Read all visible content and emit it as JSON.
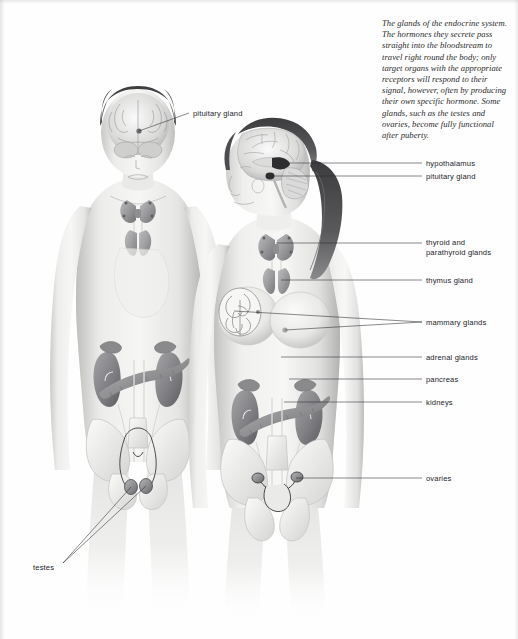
{
  "figure": {
    "title": "The glands of the endocrine system",
    "caption": "The glands of the endocrine system. The hormones they secrete pass straight into the bloodstream to travel right round the body; only target organs with the appropriate receptors will respond to their signal, however, often by producing their own specific hormone. Some glands, such as the testes and ovaries, become fully functional after puberty."
  },
  "colors": {
    "page_background": "#fefefe",
    "label_text": "#23242b",
    "caption_text": "#2b2b2b",
    "leader_line": "#2a2a30",
    "skin_light": "#f2f2f0",
    "skin_mid": "#d8d8d6",
    "skin_shadow": "#a9a9aa",
    "organ_mid": "#9a9a9c",
    "organ_dark": "#6e6e72",
    "hair_dark": "#3a3a3c"
  },
  "labels": {
    "left": [
      {
        "id": "pituitary-gland-male",
        "text": "pituitary gland",
        "x": 193,
        "y": 109,
        "leader": {
          "x1": 189,
          "y1": 113,
          "x2": 139,
          "y2": 131
        }
      },
      {
        "id": "testes",
        "text": "testes",
        "x": 33,
        "y": 563,
        "leaders": [
          {
            "x1": 63,
            "y1": 563,
            "x2": 131,
            "y2": 487
          },
          {
            "x1": 63,
            "y1": 563,
            "x2": 146,
            "y2": 486
          }
        ]
      }
    ],
    "right": [
      {
        "id": "hypothalamus",
        "text": "hypothalamus",
        "x": 426,
        "y": 159,
        "leader": {
          "x1": 422,
          "y1": 163,
          "x2": 288,
          "y2": 163
        }
      },
      {
        "id": "pituitary-gland-female",
        "text": "pituitary gland",
        "x": 426,
        "y": 172,
        "leader": {
          "x1": 422,
          "y1": 176,
          "x2": 271,
          "y2": 176
        }
      },
      {
        "id": "thyroid-and-parathyroid-glands",
        "text": "thyroid and\nparathyroid glands",
        "x": 426,
        "y": 238,
        "leader": {
          "x1": 422,
          "y1": 243,
          "x2": 276,
          "y2": 243
        }
      },
      {
        "id": "thymus-gland",
        "text": "thymus gland",
        "x": 426,
        "y": 276,
        "leader": {
          "x1": 422,
          "y1": 280,
          "x2": 281,
          "y2": 280
        }
      },
      {
        "id": "mammary-glands",
        "text": "mammary glands",
        "x": 426,
        "y": 318,
        "leaders": [
          {
            "x1": 422,
            "y1": 322,
            "x2": 234,
            "y2": 311
          },
          {
            "x1": 422,
            "y1": 322,
            "x2": 285,
            "y2": 330
          }
        ]
      },
      {
        "id": "adrenal-glands",
        "text": "adrenal glands",
        "x": 426,
        "y": 353,
        "leader": {
          "x1": 422,
          "y1": 357,
          "x2": 281,
          "y2": 357
        }
      },
      {
        "id": "pancreas",
        "text": "pancreas",
        "x": 426,
        "y": 375,
        "leader": {
          "x1": 422,
          "y1": 379,
          "x2": 289,
          "y2": 379
        }
      },
      {
        "id": "kidneys",
        "text": "kidneys",
        "x": 426,
        "y": 398,
        "leader": {
          "x1": 422,
          "y1": 402,
          "x2": 284,
          "y2": 402
        }
      },
      {
        "id": "ovaries",
        "text": "ovaries",
        "x": 426,
        "y": 474,
        "leader": {
          "x1": 422,
          "y1": 478,
          "x2": 296,
          "y2": 478
        }
      }
    ]
  },
  "figures": {
    "male": {
      "id": "male-figure",
      "description": "front-facing male body with brain, thyroid, thymus, adrenals, pancreas, kidneys, pelvis and testes visible"
    },
    "female": {
      "id": "female-figure",
      "description": "profile-head female body with sagittal brain, ponytail, breast cutaway, thyroid, thymus, adrenals, pancreas, kidneys, pelvis and ovaries visible"
    }
  }
}
